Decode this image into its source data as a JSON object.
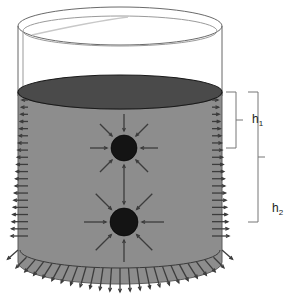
{
  "figure": {
    "name": "hydrostatic-pressure-cylinder-diagram",
    "caption_labels": {
      "h1": "h",
      "h1_sub": "1",
      "h2": "h",
      "h2_sub": "2"
    },
    "colors": {
      "fluid_body": "#8d8d8d",
      "fluid_surface": "#4a4a4a",
      "sphere": "#141414",
      "arrow": "#3c3c3c",
      "outline": "#555555",
      "background": "#ffffff",
      "label_text": "#222222"
    },
    "elements": {
      "container_label": "cylindrical container",
      "fluid_label": "fluid body",
      "fluid_surface_label": "fluid surface",
      "upper_sphere_label": "upper submerged sphere",
      "lower_sphere_label": "lower submerged sphere",
      "wall_pressure_label": "wall pressure arrows",
      "bottom_pressure_label": "bottom pressure arrows",
      "dimension_h1_label": "depth of upper sphere",
      "dimension_h2_label": "depth of lower sphere"
    },
    "geometry": {
      "cylinder_left": 18,
      "cylinder_right": 222,
      "cylinder_cx": 120,
      "rim_cy": 26,
      "rim_rx": 102,
      "rim_ry": 19,
      "surface_cy": 92,
      "surface_rx": 102,
      "surface_ry": 17,
      "bottom_cy": 262,
      "bottom_rx": 102,
      "bottom_ry": 22,
      "upper_sphere": {
        "cx": 124,
        "cy": 148,
        "r": 13
      },
      "lower_sphere": {
        "cx": 124,
        "cy": 222,
        "r": 14
      },
      "wall_arrow_count": 20,
      "bottom_arrow_count": 25,
      "sphere_arrow_count": 8
    },
    "dimensions": {
      "h1_top_y": 92,
      "h1_bottom_y": 148,
      "h1_bracket_x": 236,
      "h1_label_x": 252,
      "h1_label_y": 123,
      "h2_top_y": 92,
      "h2_bottom_y": 222,
      "h2_bracket_x": 258,
      "h2_label_x": 272,
      "h2_label_y": 212
    }
  }
}
